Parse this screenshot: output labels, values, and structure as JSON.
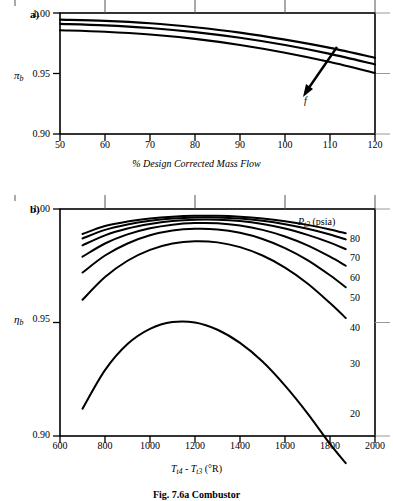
{
  "figure": {
    "caption": "Fig. 7.6a  Combustor",
    "panels": [
      {
        "letter": "a)",
        "y_symbol": "π",
        "y_subscript": "b",
        "x_title": "% Design Corrected Mass Flow",
        "y_ticks": [
          "1.00",
          "0.95",
          "0.90"
        ],
        "x_ticks": [
          "50",
          "60",
          "70",
          "80",
          "90",
          "100",
          "110",
          "120"
        ],
        "annotation_label": "f"
      },
      {
        "letter": "b)",
        "y_symbol": "η",
        "y_subscript": "b",
        "x_title_main": "T",
        "x_title_sub1": "t4",
        "x_title_dash": " - ",
        "x_title_main2": "T",
        "x_title_sub2": "t3",
        "x_title_units": " (°R)",
        "y_ticks": [
          "1.00",
          "0.95",
          "0.90"
        ],
        "x_ticks": [
          "600",
          "800",
          "1000",
          "1200",
          "1400",
          "1600",
          "1800",
          "2000"
        ],
        "legend_title_sym": "P",
        "legend_title_sub": "t3",
        "legend_title_units": " (psia)",
        "legend_values": [
          "80",
          "70",
          "60",
          "50",
          "40",
          "30",
          "20"
        ]
      }
    ]
  },
  "chart_data": [
    {
      "type": "line",
      "title": "a) Combustor total pressure ratio vs corrected mass flow",
      "xlabel": "% Design Corrected Mass Flow",
      "ylabel": "π_b",
      "xlim": [
        50,
        120
      ],
      "ylim": [
        0.9,
        1.0
      ],
      "xticks": [
        50,
        60,
        70,
        80,
        90,
        100,
        110,
        120
      ],
      "yticks": [
        1.0,
        0.95,
        0.9
      ],
      "grid": false,
      "annotation": {
        "label": "f",
        "meaning": "increasing fuel-air ratio",
        "arrow_from_x": 108,
        "arrow_from_y": 0.972,
        "arrow_to_x": 101,
        "arrow_to_y": 0.9545
      },
      "series": [
        {
          "name": "f low",
          "x": [
            50,
            60,
            70,
            80,
            90,
            100,
            110,
            120
          ],
          "values": [
            0.9945,
            0.9935,
            0.9915,
            0.9882,
            0.9838,
            0.978,
            0.9712,
            0.963
          ]
        },
        {
          "name": "f mid",
          "x": [
            50,
            60,
            70,
            80,
            90,
            100,
            110,
            120
          ],
          "values": [
            0.991,
            0.9898,
            0.9876,
            0.9842,
            0.9795,
            0.9735,
            0.9662,
            0.9575
          ]
        },
        {
          "name": "f high",
          "x": [
            50,
            60,
            70,
            80,
            90,
            100,
            110,
            120
          ],
          "values": [
            0.9858,
            0.9845,
            0.9822,
            0.9786,
            0.9736,
            0.9672,
            0.9595,
            0.9505
          ]
        }
      ]
    },
    {
      "type": "line",
      "title": "b) Combustor efficiency vs combustor temperature rise",
      "xlabel": "T_t4 - T_t3 (°R)",
      "ylabel": "η_b",
      "xlim": [
        600,
        2000
      ],
      "ylim": [
        0.9,
        1.0
      ],
      "xticks": [
        600,
        800,
        1000,
        1200,
        1400,
        1600,
        1800,
        2000
      ],
      "yticks": [
        1.0,
        0.95,
        0.9
      ],
      "grid": false,
      "legend_title": "P_t3 (psia)",
      "legend_position": "right-inside",
      "series": [
        {
          "name": "80",
          "x": [
            700,
            800,
            900,
            1000,
            1100,
            1200,
            1300,
            1400,
            1500,
            1600,
            1700,
            1800,
            1870
          ],
          "values": [
            0.989,
            0.9925,
            0.9945,
            0.9958,
            0.9966,
            0.997,
            0.997,
            0.9966,
            0.9958,
            0.9946,
            0.993,
            0.991,
            0.9893
          ]
        },
        {
          "name": "70",
          "x": [
            700,
            800,
            900,
            1000,
            1100,
            1200,
            1300,
            1400,
            1500,
            1600,
            1700,
            1800,
            1870
          ],
          "values": [
            0.987,
            0.9908,
            0.9932,
            0.9948,
            0.9958,
            0.9963,
            0.9963,
            0.9958,
            0.9948,
            0.9933,
            0.9913,
            0.9888,
            0.9866
          ]
        },
        {
          "name": "60",
          "x": [
            700,
            800,
            900,
            1000,
            1100,
            1200,
            1300,
            1400,
            1500,
            1600,
            1700,
            1800,
            1870
          ],
          "values": [
            0.984,
            0.9884,
            0.9914,
            0.9934,
            0.9947,
            0.9953,
            0.9953,
            0.9947,
            0.9934,
            0.9914,
            0.9886,
            0.9852,
            0.9823
          ]
        },
        {
          "name": "50",
          "x": [
            700,
            800,
            900,
            1000,
            1100,
            1200,
            1300,
            1400,
            1500,
            1600,
            1700,
            1800,
            1870
          ],
          "values": [
            0.979,
            0.9848,
            0.9888,
            0.9915,
            0.9931,
            0.9938,
            0.9937,
            0.9927,
            0.9908,
            0.9879,
            0.984,
            0.979,
            0.975
          ]
        },
        {
          "name": "40",
          "x": [
            700,
            800,
            900,
            1000,
            1100,
            1200,
            1300,
            1400,
            1500,
            1600,
            1700,
            1800,
            1870
          ],
          "values": [
            0.972,
            0.9795,
            0.9848,
            0.9884,
            0.9905,
            0.9913,
            0.991,
            0.9895,
            0.9868,
            0.9828,
            0.9775,
            0.9708,
            0.9655
          ]
        },
        {
          "name": "30",
          "x": [
            700,
            800,
            900,
            1000,
            1100,
            1200,
            1300,
            1400,
            1500,
            1600,
            1700,
            1800,
            1870
          ],
          "values": [
            0.96,
            0.97,
            0.9772,
            0.982,
            0.9848,
            0.9858,
            0.9853,
            0.9832,
            0.9795,
            0.9742,
            0.9672,
            0.9586,
            0.952
          ]
        },
        {
          "name": "20",
          "x": [
            700,
            800,
            900,
            1000,
            1100,
            1200,
            1300,
            1400,
            1500,
            1600,
            1700,
            1800,
            1870
          ],
          "values": [
            0.912,
            0.929,
            0.9405,
            0.9472,
            0.9502,
            0.95,
            0.9468,
            0.941,
            0.9328,
            0.9222,
            0.91,
            0.8965,
            0.888
          ]
        }
      ]
    }
  ]
}
